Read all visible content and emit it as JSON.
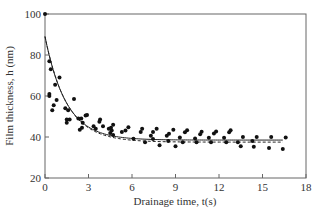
{
  "chart_data": {
    "type": "scatter",
    "title": "",
    "xlabel": "Drainage time,  t(s)",
    "ylabel": "Film thickness, h (nm)",
    "xlim": [
      0,
      18
    ],
    "ylim": [
      20,
      100
    ],
    "xticks": [
      0,
      3,
      6,
      9,
      12,
      15,
      18
    ],
    "yticks": [
      20,
      40,
      60,
      80,
      100
    ],
    "grid": false,
    "legend": null,
    "series": [
      {
        "name": "measured",
        "kind": "points",
        "points": [
          [
            0.0,
            100
          ],
          [
            0.3,
            77
          ],
          [
            0.4,
            73
          ],
          [
            0.7,
            65.5
          ],
          [
            1.0,
            69
          ],
          [
            0.3,
            61
          ],
          [
            0.3,
            60
          ],
          [
            0.8,
            58
          ],
          [
            2.0,
            58.5
          ],
          [
            0.6,
            55.5
          ],
          [
            0.5,
            53
          ],
          [
            1.4,
            54
          ],
          [
            1.6,
            53
          ],
          [
            1.5,
            48.5
          ],
          [
            1.7,
            48.5
          ],
          [
            1.5,
            47
          ],
          [
            2.3,
            49
          ],
          [
            2.6,
            47
          ],
          [
            2.5,
            49
          ],
          [
            2.8,
            50.5
          ],
          [
            2.9,
            50.7
          ],
          [
            2.55,
            44.5
          ],
          [
            2.4,
            43.5
          ],
          [
            3.35,
            45.3
          ],
          [
            3.5,
            44
          ],
          [
            3.75,
            47.5
          ],
          [
            3.8,
            48.5
          ],
          [
            4.0,
            45.3
          ],
          [
            4.4,
            44
          ],
          [
            4.55,
            44.5
          ],
          [
            4.7,
            46
          ],
          [
            4.5,
            42
          ],
          [
            4.7,
            41
          ],
          [
            4.6,
            43.2
          ],
          [
            5.3,
            42.5
          ],
          [
            5.55,
            43.2
          ],
          [
            5.75,
            44.7
          ],
          [
            6.1,
            39.2
          ],
          [
            6.6,
            42.4
          ],
          [
            6.7,
            44
          ],
          [
            6.9,
            37.5
          ],
          [
            7.3,
            40.6
          ],
          [
            7.45,
            42.4
          ],
          [
            7.7,
            44
          ],
          [
            7.45,
            39
          ],
          [
            7.9,
            36
          ],
          [
            8.4,
            40.6
          ],
          [
            8.55,
            41.6
          ],
          [
            8.85,
            43.5
          ],
          [
            8.5,
            38
          ],
          [
            9.0,
            35.5
          ],
          [
            9.3,
            39.8
          ],
          [
            9.5,
            37.4
          ],
          [
            9.65,
            42.3
          ],
          [
            9.8,
            43.3
          ],
          [
            10.35,
            39.3
          ],
          [
            10.45,
            37.5
          ],
          [
            10.7,
            41.4
          ],
          [
            10.8,
            42.6
          ],
          [
            11.3,
            39.6
          ],
          [
            11.45,
            37.5
          ],
          [
            11.65,
            41.7
          ],
          [
            11.8,
            42.7
          ],
          [
            12.35,
            39.6
          ],
          [
            12.5,
            37.4
          ],
          [
            12.7,
            42.3
          ],
          [
            12.8,
            43.3
          ],
          [
            13.3,
            37.5
          ],
          [
            13.5,
            35.5
          ],
          [
            13.65,
            40
          ],
          [
            14.3,
            38
          ],
          [
            14.4,
            35.3
          ],
          [
            14.6,
            40
          ],
          [
            15.45,
            34.6
          ],
          [
            15.6,
            40
          ],
          [
            16.4,
            34.2
          ],
          [
            16.6,
            39.7
          ]
        ]
      },
      {
        "name": "fit (solid)",
        "kind": "line",
        "style": "solid",
        "model": "h = h_inf + (h0 - h_inf) * exp(-t / tau)",
        "h0": 89,
        "h_inf": 38.5,
        "tau": 1.45,
        "t_range": [
          0,
          16.4
        ]
      },
      {
        "name": "fit (dashed)",
        "kind": "line",
        "style": "dashed",
        "model": "h = h_inf + (h0 - h_inf) * exp(-t / tau)",
        "h0": 89,
        "h_inf": 37.5,
        "tau": 1.5,
        "t_range": [
          0,
          16.4
        ]
      }
    ]
  },
  "colors": {
    "axis": "#555555",
    "points": "#111111",
    "line": "#222222"
  }
}
